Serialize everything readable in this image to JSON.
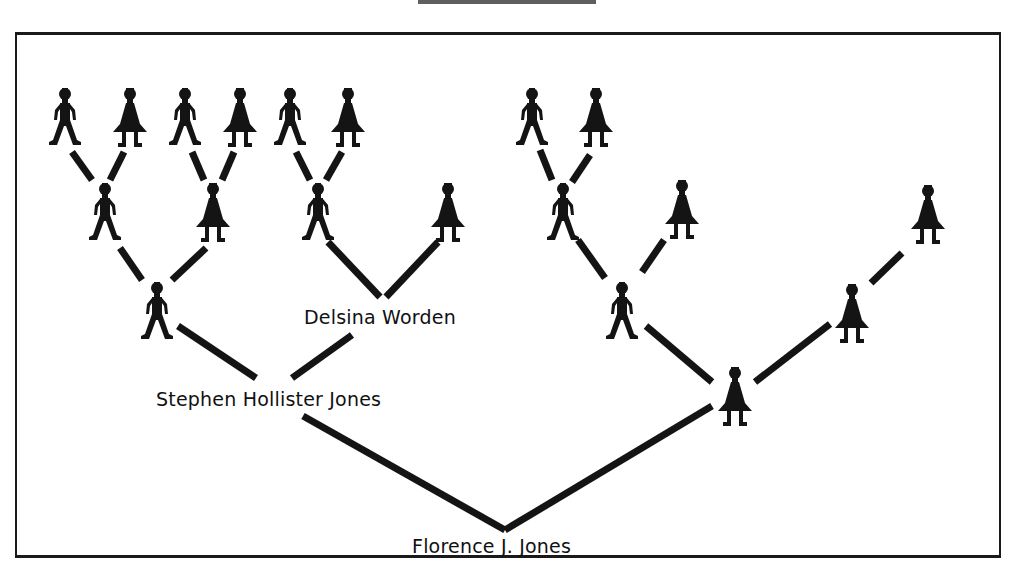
{
  "diagram": {
    "type": "pedigree-chart",
    "title_visible": false,
    "colors": {
      "ink": "#141414",
      "background": "#ffffff",
      "frame": "#1a1a1a"
    },
    "labels": {
      "root": "Florence J. Jones",
      "father": "Stephen Hollister Jones",
      "paternal_grandmother": "Delsina Worden"
    },
    "figure_legend": {
      "male": "male-figure-icon (stick figure)",
      "female": "female-figure-icon (dress figure)"
    },
    "figures": [
      {
        "id": "g4-1",
        "sex": "male",
        "x": 65,
        "y": 88
      },
      {
        "id": "g4-2",
        "sex": "female",
        "x": 130,
        "y": 88
      },
      {
        "id": "g4-3",
        "sex": "male",
        "x": 185,
        "y": 88
      },
      {
        "id": "g4-4",
        "sex": "female",
        "x": 240,
        "y": 88
      },
      {
        "id": "g4-5",
        "sex": "male",
        "x": 290,
        "y": 88
      },
      {
        "id": "g4-6",
        "sex": "female",
        "x": 348,
        "y": 88
      },
      {
        "id": "g4-7",
        "sex": "male",
        "x": 532,
        "y": 88
      },
      {
        "id": "g4-8",
        "sex": "female",
        "x": 596,
        "y": 88
      },
      {
        "id": "g3-1",
        "sex": "male",
        "x": 105,
        "y": 183
      },
      {
        "id": "g3-2",
        "sex": "female",
        "x": 213,
        "y": 183
      },
      {
        "id": "g3-3",
        "sex": "male",
        "x": 318,
        "y": 183
      },
      {
        "id": "g3-4",
        "sex": "female",
        "x": 448,
        "y": 183
      },
      {
        "id": "g3-5",
        "sex": "male",
        "x": 563,
        "y": 183
      },
      {
        "id": "g3-6",
        "sex": "female",
        "x": 682,
        "y": 180
      },
      {
        "id": "g3-8",
        "sex": "female",
        "x": 928,
        "y": 185
      },
      {
        "id": "g2-1",
        "sex": "male",
        "x": 157,
        "y": 282
      },
      {
        "id": "g2-3",
        "sex": "male",
        "x": 622,
        "y": 282
      },
      {
        "id": "g2-4",
        "sex": "female",
        "x": 852,
        "y": 284
      },
      {
        "id": "g1-2",
        "sex": "female",
        "x": 735,
        "y": 367
      }
    ]
  }
}
